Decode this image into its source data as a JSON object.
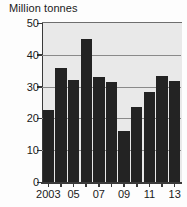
{
  "chart_data": {
    "type": "bar",
    "title": "Million tonnes",
    "xlabel": "",
    "ylabel": "",
    "ylim": [
      0,
      50
    ],
    "yticks": [
      0,
      10,
      20,
      30,
      40,
      50
    ],
    "ytick_labels": [
      "0",
      "10",
      "20",
      "30",
      "40",
      "50"
    ],
    "grid": true,
    "grid_axis": "y",
    "legend": false,
    "bar_color": "#232323",
    "plot_background": "#e9e9e9",
    "categories": [
      "2003",
      "2004",
      "2005",
      "2006",
      "2007",
      "2008",
      "2009",
      "2010",
      "2011",
      "2012",
      "2013"
    ],
    "xtick_labels": [
      "2003",
      "",
      "05",
      "",
      "07",
      "",
      "09",
      "",
      "11",
      "",
      "13"
    ],
    "values": [
      22.8,
      35.8,
      32.0,
      45.0,
      33.0,
      31.5,
      16.0,
      23.5,
      28.2,
      33.2,
      31.8
    ]
  }
}
